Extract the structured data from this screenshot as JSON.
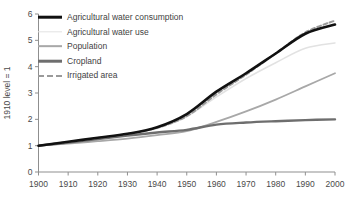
{
  "chart_data": {
    "type": "line",
    "title": "",
    "subtitle": "",
    "xlabel": "",
    "ylabel": "1910 level = 1",
    "xlim": [
      1900,
      2000
    ],
    "ylim": [
      0,
      6
    ],
    "grid": false,
    "legend_position": "top-left",
    "x_ticks": [
      "1900",
      "1910",
      "1920",
      "1930",
      "1940",
      "1950",
      "1960",
      "1970",
      "1980",
      "1990",
      "2000"
    ],
    "y_ticks": [
      "0",
      "1",
      "2",
      "3",
      "4",
      "5",
      "6"
    ],
    "x": [
      1900,
      1910,
      1920,
      1930,
      1940,
      1950,
      1960,
      1970,
      1980,
      1990,
      2000
    ],
    "series": [
      {
        "name": "Agricultural water consumption",
        "color": "#111111",
        "style": "solid",
        "width": 2.6,
        "values": [
          1.0,
          1.15,
          1.3,
          1.45,
          1.7,
          2.2,
          3.05,
          3.75,
          4.5,
          5.25,
          5.6
        ]
      },
      {
        "name": "Agricultural water use",
        "color": "#e2e2e2",
        "style": "solid",
        "width": 1.5,
        "values": [
          1.0,
          1.12,
          1.26,
          1.42,
          1.65,
          2.1,
          2.85,
          3.55,
          4.15,
          4.7,
          4.9
        ]
      },
      {
        "name": "Population",
        "color": "#a8a8a8",
        "style": "solid",
        "width": 1.8,
        "values": [
          1.0,
          1.08,
          1.17,
          1.27,
          1.4,
          1.55,
          1.9,
          2.3,
          2.75,
          3.25,
          3.75
        ]
      },
      {
        "name": "Cropland",
        "color": "#6e6e6e",
        "style": "solid",
        "width": 2.4,
        "values": [
          1.0,
          1.12,
          1.25,
          1.38,
          1.5,
          1.6,
          1.8,
          1.88,
          1.93,
          1.97,
          2.0
        ]
      },
      {
        "name": "Irrigated area",
        "color": "#9a9a9a",
        "style": "dashed",
        "width": 2.0,
        "values": [
          1.0,
          1.14,
          1.29,
          1.44,
          1.68,
          2.12,
          2.95,
          3.7,
          4.5,
          5.3,
          5.75
        ]
      }
    ]
  },
  "legend": {
    "items": [
      {
        "label": "Agricultural water consumption",
        "key": "consumption"
      },
      {
        "label": "Agricultural water use",
        "key": "use"
      },
      {
        "label": "Population",
        "key": "population"
      },
      {
        "label": "Cropland",
        "key": "cropland"
      },
      {
        "label": "Irrigated area",
        "key": "irrigated"
      }
    ]
  },
  "axis": {
    "y_title": "1910 level = 1"
  }
}
